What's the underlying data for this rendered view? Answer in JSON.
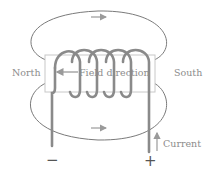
{
  "diagram": {
    "labels": {
      "north": "North",
      "south": "South",
      "field_direction": "Field direction",
      "current": "Current",
      "negative_terminal": "−",
      "positive_terminal": "+"
    },
    "coil": {
      "turns": 5
    },
    "colors": {
      "field_lines": "#7a7a7a",
      "coil": "#8a8a8a",
      "core_outline": "#c8c8c8",
      "text": "#8c8c8c",
      "arrows": "#9a9a9a"
    }
  }
}
